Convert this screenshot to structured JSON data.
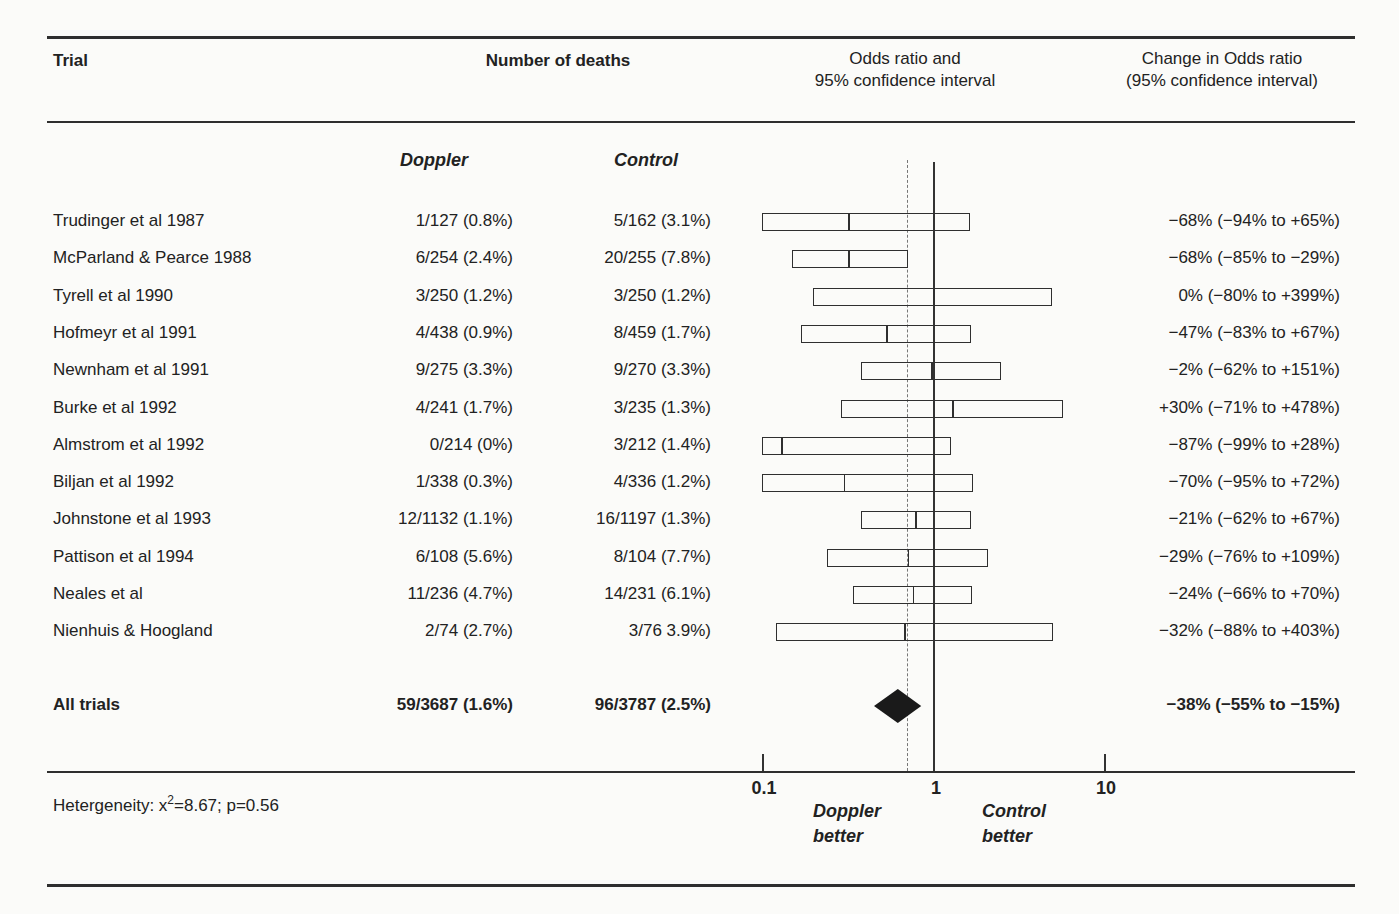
{
  "header": {
    "col_trial": "Trial",
    "col_deaths": "Number of deaths",
    "col_or_line1": "Odds ratio and",
    "col_or_line2": "95% confidence interval",
    "col_change_line1": "Change in Odds ratio",
    "col_change_line2": "(95% confidence interval)"
  },
  "subheader": {
    "doppler": "Doppler",
    "control": "Control"
  },
  "axis": {
    "tick_labels": [
      "0.1",
      "1",
      "10"
    ],
    "left_line1": "Doppler",
    "left_line2": "better",
    "right_line1": "Control",
    "right_line2": "better"
  },
  "footnote": {
    "prefix": "Hetergeneity: x",
    "sup": "2",
    "suffix": "=8.67; p=0.56"
  },
  "chart_data": {
    "type": "scatter",
    "subtype": "forest-plot",
    "title": "Odds ratio and 95% confidence interval",
    "x_scale": "log10",
    "x_ticks": [
      0.1,
      1,
      10
    ],
    "x_range": [
      0.1,
      30
    ],
    "grid": false,
    "legend_position": "none",
    "reference_line_x": 1.0,
    "dashed_line_x": 0.7,
    "left_region_label": "Doppler better",
    "right_region_label": "Control better",
    "heterogeneity": "x2=8.67; p=0.56",
    "studies": [
      {
        "trial": "Trudinger et al 1987",
        "doppler": "1/127 (0.8%)",
        "control": "5/162 (3.1%)",
        "or": 0.32,
        "ci": [
          0.06,
          1.65
        ],
        "change": "−68% (−94% to +65%)"
      },
      {
        "trial": "McParland & Pearce 1988",
        "doppler": "6/254 (2.4%)",
        "control": "20/255 (7.8%)",
        "or": 0.32,
        "ci": [
          0.15,
          0.71
        ],
        "change": "−68% (−85% to −29%)"
      },
      {
        "trial": "Tyrell et al 1990",
        "doppler": "3/250 (1.2%)",
        "control": "3/250 (1.2%)",
        "or": 1.0,
        "ci": [
          0.2,
          4.99
        ],
        "change": "0% (−80% to +399%)"
      },
      {
        "trial": "Hofmeyr et al 1991",
        "doppler": "4/438 (0.9%)",
        "control": "8/459 (1.7%)",
        "or": 0.53,
        "ci": [
          0.17,
          1.67
        ],
        "change": "−47% (−83% to +67%)"
      },
      {
        "trial": "Newnham et al 1991",
        "doppler": "9/275 (3.3%)",
        "control": "9/270 (3.3%)",
        "or": 0.98,
        "ci": [
          0.38,
          2.51
        ],
        "change": "−2% (−62% to +151%)"
      },
      {
        "trial": "Burke et al 1992",
        "doppler": "4/241 (1.7%)",
        "control": "3/235 (1.3%)",
        "or": 1.3,
        "ci": [
          0.29,
          5.78
        ],
        "change": "+30% (−71% to +478%)"
      },
      {
        "trial": "Almstrom et al 1992",
        "doppler": "0/214 (0%)",
        "control": "3/212 (1.4%)",
        "or": 0.13,
        "ci": [
          0.01,
          1.28
        ],
        "change": "−87% (−99% to +28%)"
      },
      {
        "trial": "Biljan et al 1992",
        "doppler": "1/338 (0.3%)",
        "control": "4/336 (1.2%)",
        "or": 0.3,
        "ci": [
          0.05,
          1.72
        ],
        "change": "−70% (−95% to +72%)"
      },
      {
        "trial": "Johnstone et al 1993",
        "doppler": "12/1132 (1.1%)",
        "control": "16/1197 (1.3%)",
        "or": 0.79,
        "ci": [
          0.38,
          1.67
        ],
        "change": "−21% (−62% to +67%)"
      },
      {
        "trial": "Pattison et al 1994",
        "doppler": "6/108 (5.6%)",
        "control": "8/104 (7.7%)",
        "or": 0.71,
        "ci": [
          0.24,
          2.09
        ],
        "change": "−29% (−76% to +109%)"
      },
      {
        "trial": "Neales et al",
        "doppler": "11/236 (4.7%)",
        "control": "14/231 (6.1%)",
        "or": 0.76,
        "ci": [
          0.34,
          1.7
        ],
        "change": "−24% (−66% to +70%)"
      },
      {
        "trial": "Nienhuis & Hoogland",
        "doppler": "2/74 (2.7%)",
        "control": "3/76 3.9%)",
        "or": 0.68,
        "ci": [
          0.12,
          5.03
        ],
        "change": "−32% (−88% to +403%)"
      }
    ],
    "pooled": {
      "trial": "All trials",
      "doppler": "59/3687 (1.6%)",
      "control": "96/3787 (2.5%)",
      "or": 0.62,
      "ci": [
        0.45,
        0.85
      ],
      "change": "−38% (−55% to −15%)"
    }
  },
  "colors": {
    "ink": "#2e2e2e",
    "paper": "#fbfbf9",
    "diamond": "#1a1a1a"
  }
}
